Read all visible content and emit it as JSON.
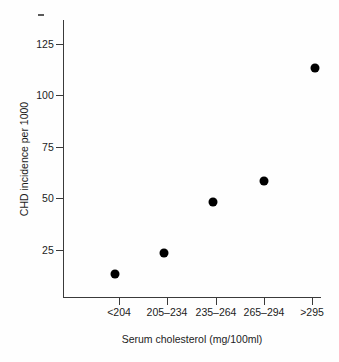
{
  "chart_data": {
    "type": "scatter",
    "title": "",
    "xlabel": "Serum cholesterol (mg/100ml)",
    "ylabel": "CHD incidence per 1000",
    "categories": [
      "<204",
      "205–234",
      "235–264",
      "265–294",
      ">295"
    ],
    "values": [
      11,
      21,
      48,
      58,
      114
    ],
    "x_tick_labels": [
      "<204",
      "205–234",
      "235–264",
      "265–294",
      ">295"
    ],
    "y_tick_labels": [
      "25",
      "50",
      "75",
      "100",
      "125"
    ],
    "y_tick_values": [
      25,
      50,
      75,
      100,
      125
    ],
    "ylim": [
      0,
      135
    ],
    "grid": false,
    "legend": false,
    "marker": "filled-circle",
    "marker_color": "#000000",
    "axis_color": "#3a3a3a",
    "background_color": "#fefefe",
    "points": [
      {
        "category": "<204",
        "value": 11
      },
      {
        "category": "205–234",
        "value": 21
      },
      {
        "category": "235–264",
        "value": 48
      },
      {
        "category": "265–294",
        "value": 58
      },
      {
        "category": ">295",
        "value": 114
      }
    ]
  },
  "axes": {
    "y_ticks": [
      {
        "label": "125",
        "top": 44
      },
      {
        "label": "100",
        "top": 95
      },
      {
        "label": "75",
        "top": 147
      },
      {
        "label": "50",
        "top": 198
      },
      {
        "label": "25",
        "top": 250
      }
    ],
    "x_ticks": [
      {
        "label": "<204",
        "left": 119
      },
      {
        "label": "205–234",
        "left": 167
      },
      {
        "label": "235–264",
        "left": 216
      },
      {
        "label": "265–294",
        "left": 264
      },
      {
        "label": ">295",
        "left": 312
      }
    ]
  },
  "markers": [
    {
      "label": "<204",
      "value": 11,
      "left": 115,
      "top": 274
    },
    {
      "label": "205–234",
      "value": 21,
      "left": 164,
      "top": 253
    },
    {
      "label": "235–264",
      "value": 48,
      "left": 213,
      "top": 202
    },
    {
      "label": "265–294",
      "value": 58,
      "left": 264,
      "top": 181
    },
    {
      "label": ">295",
      "value": 114,
      "left": 315,
      "top": 68
    }
  ]
}
